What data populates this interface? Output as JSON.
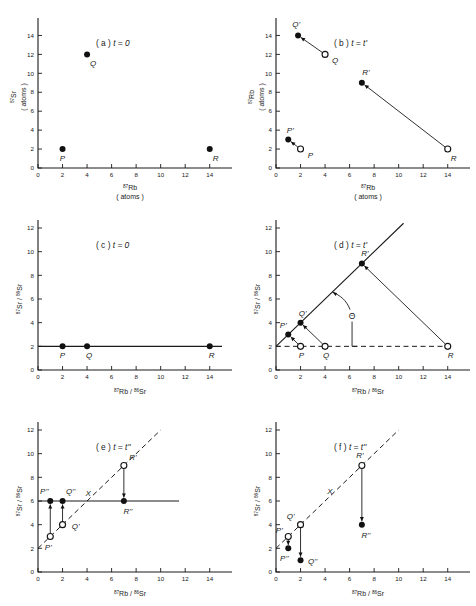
{
  "figure": {
    "caption_none": "",
    "axis_labels": {
      "rb_atoms_l1": "87Rb",
      "rb_atoms_l2": "( atoms )",
      "sr_atoms_l1": "87Sr",
      "sr_atoms_l2": "( atoms )",
      "rb_sup": "87",
      "rb_base": "Rb",
      "sr_sup": "87",
      "sr_base": "Sr",
      "sr86_sup": "86",
      "sr86_base": "Sr",
      "atoms": "( atoms )",
      "ratio_x": "87Rb / 86Sr",
      "ratio_y": "87Sr / 86Sr"
    },
    "theta_symbol": "Θ",
    "x_marker": "X"
  },
  "chart_data": [
    {
      "type": "scatter",
      "panel": "a",
      "title_prefix": "( a )",
      "title_cond": "t = 0",
      "xlabel": "87Rb ( atoms )",
      "ylabel": "87Sr ( atoms )",
      "xlim": [
        0,
        15
      ],
      "ylim": [
        0,
        15
      ],
      "xticks": [
        0,
        2,
        4,
        6,
        8,
        10,
        12,
        14
      ],
      "yticks": [
        0,
        2,
        4,
        6,
        8,
        10,
        12,
        14
      ],
      "grid": false,
      "points": [
        {
          "label": "P",
          "x": 2,
          "y": 2,
          "style": "filled"
        },
        {
          "label": "Q",
          "x": 4,
          "y": 12,
          "style": "filled"
        },
        {
          "label": "R",
          "x": 14,
          "y": 2,
          "style": "filled"
        }
      ]
    },
    {
      "type": "scatter",
      "panel": "b",
      "title_prefix": "( b )",
      "title_cond": "t = t'",
      "xlabel": "87Rb ( atoms )",
      "ylabel": "87Rb ( atoms )",
      "xlim": [
        0,
        15
      ],
      "ylim": [
        0,
        15
      ],
      "xticks": [
        0,
        2,
        4,
        6,
        8,
        10,
        12,
        14
      ],
      "yticks": [
        0,
        2,
        4,
        6,
        8,
        10,
        12,
        14
      ],
      "grid": false,
      "points": [
        {
          "label": "P",
          "x": 2,
          "y": 2,
          "style": "open"
        },
        {
          "label": "Q",
          "x": 4,
          "y": 12,
          "style": "open"
        },
        {
          "label": "R",
          "x": 14,
          "y": 2,
          "style": "open"
        },
        {
          "label": "P'",
          "x": 1,
          "y": 3,
          "style": "filled"
        },
        {
          "label": "Q'",
          "x": 1.8,
          "y": 14,
          "style": "filled"
        },
        {
          "label": "R'",
          "x": 7,
          "y": 9,
          "style": "filled"
        }
      ],
      "arrows": [
        {
          "from": [
            2,
            2
          ],
          "to": [
            1,
            3
          ]
        },
        {
          "from": [
            4,
            12
          ],
          "to": [
            1.8,
            14
          ]
        },
        {
          "from": [
            14,
            2
          ],
          "to": [
            7,
            9
          ]
        }
      ]
    },
    {
      "type": "scatter",
      "panel": "c",
      "title_prefix": "( c )",
      "title_cond": "t = 0",
      "xlabel": "87Rb / 86Sr",
      "ylabel": "87Sr / 86Sr",
      "xlim": [
        0,
        15
      ],
      "ylim": [
        0,
        12
      ],
      "xticks": [
        0,
        2,
        4,
        6,
        8,
        10,
        12,
        14
      ],
      "yticks": [
        0,
        2,
        4,
        6,
        8,
        10,
        12
      ],
      "grid": false,
      "points": [
        {
          "label": "P",
          "x": 2,
          "y": 2,
          "style": "filled"
        },
        {
          "label": "Q",
          "x": 4,
          "y": 2,
          "style": "filled"
        },
        {
          "label": "R",
          "x": 14,
          "y": 2,
          "style": "filled"
        }
      ],
      "isochron": {
        "intercept": 2,
        "slope": 0,
        "style": "solid",
        "x_from": 0,
        "x_to": 15
      }
    },
    {
      "type": "scatter",
      "panel": "d",
      "title_prefix": "( d )",
      "title_cond": "t = t'",
      "xlabel": "87Rb / 86Sr",
      "ylabel": "87Sr / 86Sr",
      "xlim": [
        0,
        15
      ],
      "ylim": [
        0,
        12
      ],
      "xticks": [
        0,
        2,
        4,
        6,
        8,
        10,
        12,
        14
      ],
      "yticks": [
        0,
        2,
        4,
        6,
        8,
        10,
        12
      ],
      "grid": false,
      "points": [
        {
          "label": "P",
          "x": 2,
          "y": 2,
          "style": "open"
        },
        {
          "label": "Q",
          "x": 4,
          "y": 2,
          "style": "open"
        },
        {
          "label": "R",
          "x": 14,
          "y": 2,
          "style": "open"
        },
        {
          "label": "P'",
          "x": 1,
          "y": 3,
          "style": "filled"
        },
        {
          "label": "Q'",
          "x": 2,
          "y": 4,
          "style": "filled"
        },
        {
          "label": "R'",
          "x": 7,
          "y": 9,
          "style": "filled"
        }
      ],
      "arrows": [
        {
          "from": [
            2,
            2
          ],
          "to": [
            1,
            3
          ]
        },
        {
          "from": [
            4,
            2
          ],
          "to": [
            2,
            4
          ]
        },
        {
          "from": [
            14,
            2
          ],
          "to": [
            7,
            9
          ]
        }
      ],
      "isochron": {
        "intercept": 2,
        "slope": 1,
        "style": "solid",
        "x_from": 0,
        "x_to": 10.4
      },
      "baseline": {
        "intercept": 2,
        "slope": 0,
        "style": "dashed",
        "x_from": 0,
        "x_to": 14
      },
      "angle_annotation": {
        "symbol": "Θ",
        "vertex": [
          0,
          2
        ],
        "at_x": 6.2,
        "at_y": 4.6
      }
    },
    {
      "type": "scatter",
      "panel": "e",
      "title_prefix": "( e )",
      "title_cond": "t = t''",
      "xlabel": "87Rb / 86Sr",
      "ylabel": "87Sr / 86Sr",
      "xlim": [
        0,
        15
      ],
      "ylim": [
        0,
        12
      ],
      "xticks": [
        0,
        2,
        4,
        6,
        8,
        10,
        12,
        14
      ],
      "yticks": [
        0,
        2,
        4,
        6,
        8,
        10,
        12
      ],
      "grid": false,
      "points": [
        {
          "label": "P'",
          "x": 1,
          "y": 3,
          "style": "open"
        },
        {
          "label": "Q'",
          "x": 2,
          "y": 4,
          "style": "open"
        },
        {
          "label": "R'",
          "x": 7,
          "y": 9,
          "style": "open"
        },
        {
          "label": "P''",
          "x": 1,
          "y": 6,
          "style": "filled"
        },
        {
          "label": "Q''",
          "x": 2,
          "y": 6,
          "style": "filled"
        },
        {
          "label": "R''",
          "x": 7,
          "y": 6,
          "style": "filled"
        }
      ],
      "arrows": [
        {
          "from": [
            1,
            3
          ],
          "to": [
            1,
            6
          ]
        },
        {
          "from": [
            2,
            4
          ],
          "to": [
            2,
            6
          ]
        },
        {
          "from": [
            7,
            9
          ],
          "to": [
            7,
            6
          ]
        }
      ],
      "isochron": {
        "intercept": 6,
        "slope": 0,
        "style": "solid",
        "x_from": 0,
        "x_to": 11.5
      },
      "old_isochron": {
        "intercept": 2,
        "slope": 1,
        "style": "dashed",
        "x_from": 0,
        "x_to": 10
      },
      "intersection_label": {
        "text": "X",
        "x": 4.1,
        "y": 6.4
      }
    },
    {
      "type": "scatter",
      "panel": "f",
      "title_prefix": "( f )",
      "title_cond": "t = t''",
      "xlabel": "87Rb / 86Sr",
      "ylabel": "87Sr / 86Sr",
      "xlim": [
        0,
        15
      ],
      "ylim": [
        0,
        12
      ],
      "xticks": [
        0,
        2,
        4,
        6,
        8,
        10,
        12,
        14
      ],
      "yticks": [
        0,
        2,
        4,
        6,
        8,
        10,
        12
      ],
      "grid": false,
      "points": [
        {
          "label": "P'",
          "x": 1,
          "y": 3,
          "style": "open"
        },
        {
          "label": "Q'",
          "x": 2,
          "y": 4,
          "style": "open"
        },
        {
          "label": "R'",
          "x": 7,
          "y": 9,
          "style": "open"
        },
        {
          "label": "P''",
          "x": 1,
          "y": 2,
          "style": "filled"
        },
        {
          "label": "Q''",
          "x": 2,
          "y": 1,
          "style": "filled"
        },
        {
          "label": "R''",
          "x": 7,
          "y": 4,
          "style": "filled"
        }
      ],
      "arrows": [
        {
          "from": [
            1,
            3
          ],
          "to": [
            1,
            2
          ]
        },
        {
          "from": [
            2,
            4
          ],
          "to": [
            2,
            1
          ]
        },
        {
          "from": [
            7,
            9
          ],
          "to": [
            7,
            4
          ]
        }
      ],
      "old_isochron": {
        "intercept": 2,
        "slope": 1,
        "style": "dashed",
        "x_from": 0,
        "x_to": 10
      },
      "intersection_label": {
        "text": "X",
        "x": 4.4,
        "y": 6.6
      }
    }
  ]
}
